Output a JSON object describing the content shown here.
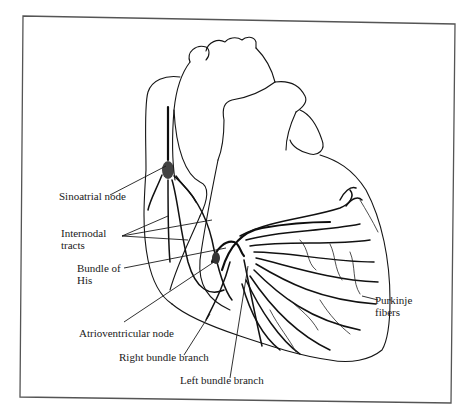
{
  "figure": {
    "frame_color": "#555555",
    "ink_color": "#151515",
    "background": "#ffffff"
  },
  "labels": {
    "sinoatrial_node": "Sinoatrial node",
    "internodal_tracts_line1": "Internodal",
    "internodal_tracts_line2": "tracts",
    "bundle_of_his_line1": "Bundle of",
    "bundle_of_his_line2": "His",
    "atrioventricular_node": "Atrioventricular node",
    "right_bundle_branch": "Right bundle branch",
    "left_bundle_branch": "Left bundle branch",
    "purkinje_fibers_line1": "Purkinje",
    "purkinje_fibers_line2": "fibers"
  }
}
